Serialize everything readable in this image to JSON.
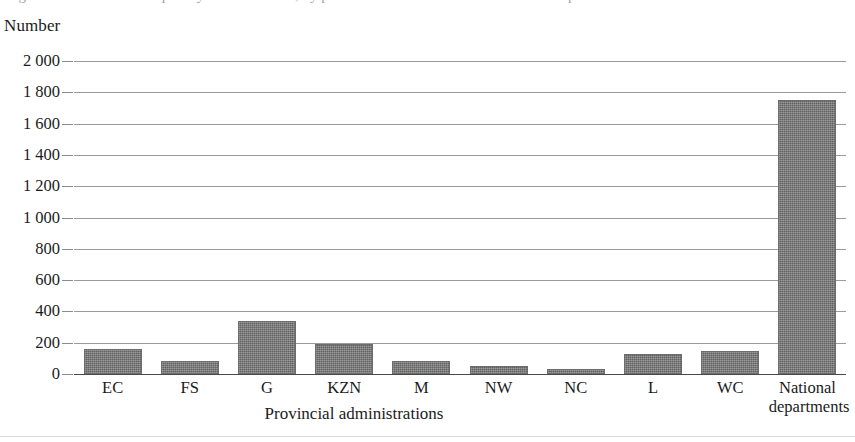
{
  "figure": {
    "caption_cutoff": "Figure 1: Number of disciplinary cases finalised, by provincial administration and national departments",
    "y_unit_label": "Number",
    "x_axis_title": "Provincial administrations",
    "bar_color": "#787878",
    "gridline_color": "#9b9b9b",
    "axis_color": "#4a4a4a"
  },
  "chart_data": {
    "type": "bar",
    "title": "",
    "xlabel": "Provincial administrations",
    "ylabel": "Number",
    "categories": [
      "EC",
      "FS",
      "G",
      "KZN",
      "M",
      "NW",
      "NC",
      "L",
      "WC",
      "National\ndepartments"
    ],
    "values": [
      160,
      80,
      340,
      190,
      80,
      50,
      35,
      125,
      145,
      1750
    ],
    "ylim": [
      0,
      2000
    ],
    "ytick_values": [
      0,
      200,
      400,
      600,
      800,
      1000,
      1200,
      1400,
      1600,
      1800,
      2000
    ],
    "ytick_labels": [
      "0",
      "200",
      "400",
      "600",
      "800",
      "1 000",
      "1 200",
      "1 400",
      "1 600",
      "1 800",
      "2 000"
    ],
    "grid": true,
    "grid_axis": "y",
    "legend": false,
    "legend_position": "none",
    "series": [
      {
        "name": "Number",
        "values": [
          160,
          80,
          340,
          190,
          80,
          50,
          35,
          125,
          145,
          1750
        ]
      }
    ]
  }
}
